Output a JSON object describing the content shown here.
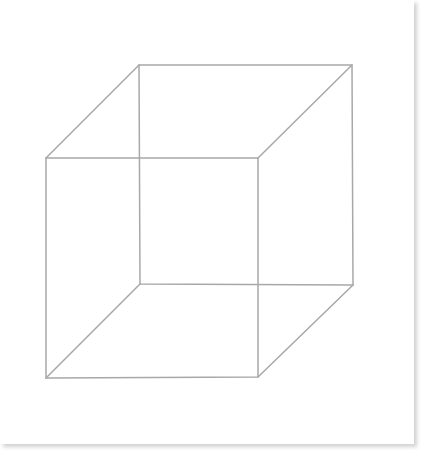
{
  "figure": {
    "line_color": "#a8a8a8",
    "background_color": "#ffffff",
    "shadow_color": "#d8d8d8",
    "vertices": {
      "back_top_left": [
        139,
        65
      ],
      "back_top_right": [
        352,
        65
      ],
      "back_bottom_right": [
        353,
        285
      ],
      "back_bottom_left": [
        140,
        284
      ],
      "front_top_left": [
        46,
        158
      ],
      "front_top_right": [
        258,
        158
      ],
      "front_bottom_right": [
        258,
        377
      ],
      "front_bottom_left": [
        46,
        378
      ]
    }
  }
}
